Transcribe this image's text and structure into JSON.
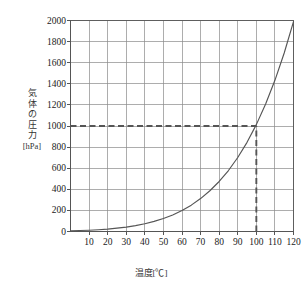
{
  "chart_data": {
    "type": "line",
    "title": "",
    "subtitle": "",
    "xlabel": "温度[℃]",
    "ylabel": "気体の圧力 [hPa]",
    "ylabel_lines": [
      "気",
      "体",
      "の",
      "圧",
      "力",
      "[hPa]"
    ],
    "xlim": [
      0,
      120
    ],
    "ylim": [
      0,
      2000
    ],
    "xticks": [
      10,
      20,
      30,
      40,
      50,
      60,
      70,
      80,
      90,
      100,
      110,
      120
    ],
    "yticks": [
      0,
      200,
      400,
      600,
      800,
      1000,
      1200,
      1400,
      1600,
      1800,
      2000
    ],
    "xtick_labels": [
      "10",
      "20",
      "30",
      "40",
      "50",
      "60",
      "70",
      "80",
      "90",
      "100",
      "110",
      "120"
    ],
    "ytick_labels": [
      "0",
      "200",
      "400",
      "600",
      "800",
      "1000",
      "1200",
      "1400",
      "1600",
      "1800",
      "2000"
    ],
    "grid": true,
    "legend": "none",
    "series": [
      {
        "name": "飽和水蒸気圧",
        "color": "#555555",
        "x": [
          0,
          5,
          10,
          15,
          20,
          25,
          30,
          35,
          40,
          45,
          50,
          55,
          60,
          65,
          70,
          75,
          80,
          85,
          90,
          95,
          100,
          105,
          110,
          115,
          120
        ],
        "values": [
          6,
          9,
          12,
          17,
          23,
          32,
          42,
          56,
          74,
          96,
          123,
          157,
          199,
          250,
          312,
          386,
          474,
          578,
          701,
          845,
          1013,
          1208,
          1433,
          1692,
          1990
        ]
      }
    ],
    "annotations": [
      {
        "name": "pressure-reference-line",
        "type": "hline",
        "value": 1000,
        "style": "dashed",
        "color": "#555555",
        "from_x": 0,
        "to_x": 100
      },
      {
        "name": "temperature-reference-line",
        "type": "vline",
        "value": 100,
        "style": "dashed",
        "color": "#555555",
        "from_y": 0,
        "to_y": 1000
      }
    ],
    "colors": {
      "axis": "#555555",
      "grid": "#8a8a8a",
      "curve": "#555555",
      "dashed": "#5a5a5a",
      "text": "#222222",
      "background": "#ffffff"
    }
  }
}
